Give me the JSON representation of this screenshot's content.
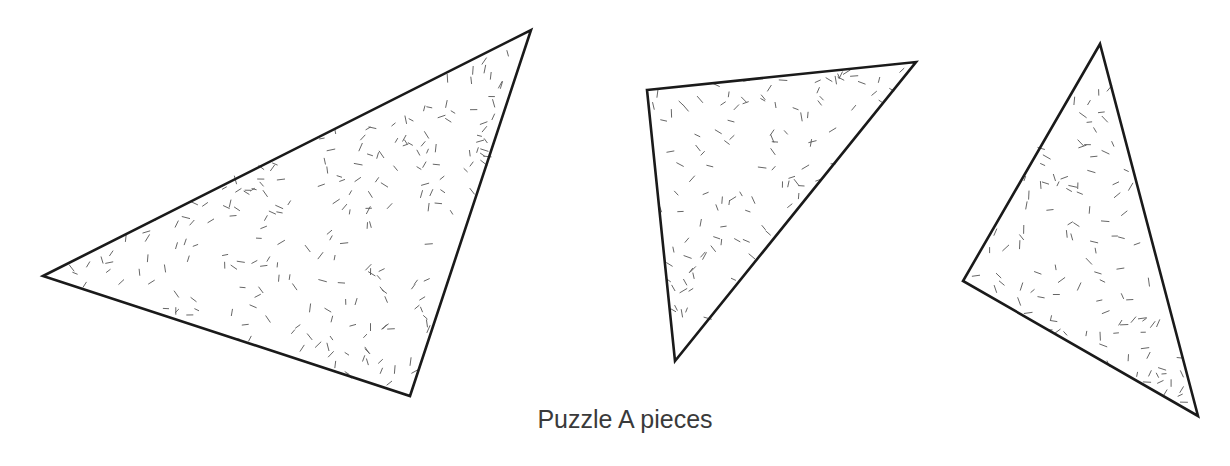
{
  "diagram": {
    "caption": "Puzzle A pieces",
    "stroke_color": "#1a1a1a",
    "hatch_color": "#555555",
    "pieces": [
      {
        "id": "piece-1",
        "points": [
          [
            43,
            276
          ],
          [
            531,
            30
          ],
          [
            410,
            396
          ]
        ]
      },
      {
        "id": "piece-2",
        "points": [
          [
            647,
            90
          ],
          [
            916,
            62
          ],
          [
            675,
            361
          ]
        ]
      },
      {
        "id": "piece-3",
        "points": [
          [
            1100,
            44
          ],
          [
            963,
            281
          ],
          [
            1198,
            416
          ]
        ]
      }
    ]
  }
}
